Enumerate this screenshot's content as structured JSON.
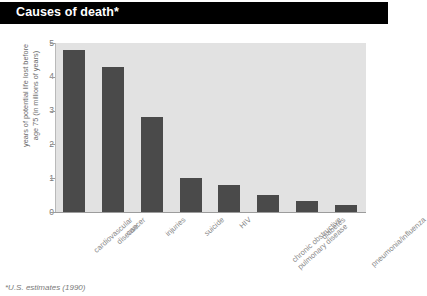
{
  "header": {
    "title": "Causes of death*"
  },
  "footnote": "*U.S. estimates (1990)",
  "colors": {
    "title_bar_background": "#000000",
    "title_text": "#ffffff",
    "plot_background": "#e2e2e2",
    "bar": "#4a4a4a",
    "axis": "#9c9c9c",
    "tick_text": "#7c7c7c",
    "label_text": "#8a8a8a"
  },
  "chart_data": {
    "type": "bar",
    "title": "Causes of death*",
    "xlabel": "",
    "ylabel": "years of potential life lost before age 75 (in millions of years)",
    "ylabel_lines": [
      "years of potential life lost before",
      "age 75 (in millions of years)"
    ],
    "categories": [
      "cardiovascular disease",
      "cancer",
      "injuries",
      "suicide",
      "HIV",
      "chronic obstructive pulmonary disease",
      "diabetes",
      "pneumonia/influenza"
    ],
    "category_lines": [
      [
        "cardiovascular",
        "disease"
      ],
      [
        "cancer"
      ],
      [
        "injuries"
      ],
      [
        "suicide"
      ],
      [
        "HIV"
      ],
      [
        "chronic obstructive",
        "pulmonary disease"
      ],
      [
        "diabetes"
      ],
      [
        "pneumonia/influenza"
      ]
    ],
    "values": [
      4.8,
      4.3,
      2.8,
      1.0,
      0.8,
      0.5,
      0.33,
      0.2
    ],
    "ylim": [
      0,
      5
    ],
    "yticks": [
      0,
      1,
      2,
      3,
      4,
      5
    ],
    "ytick_labels": [
      "0",
      "1",
      "2",
      "3",
      "4",
      "5"
    ],
    "grid": false,
    "legend": false
  }
}
